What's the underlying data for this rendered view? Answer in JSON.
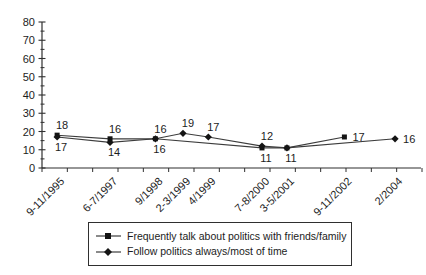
{
  "chart_data": {
    "type": "line",
    "title": "",
    "xlabel": "",
    "ylabel": "",
    "categories": [
      "9-11/1995",
      "6-7/1997",
      "9/1998",
      "2-3/1999",
      "4/1999",
      "7-8/2000",
      "3-5/2001",
      "9-11/2002",
      "2/2004"
    ],
    "series": [
      {
        "name": "Frequently talk about politics with friends/family",
        "marker": "square",
        "points": [
          {
            "category": "9-11/1995",
            "value": 18,
            "label_pos": "above"
          },
          {
            "category": "6-7/1997",
            "value": 16,
            "label_pos": "above"
          },
          {
            "category": "9/1998",
            "value": 16,
            "label_pos": "above"
          },
          {
            "category": "7-8/2000",
            "value": 11,
            "label_pos": "below"
          },
          {
            "category": "3-5/2001",
            "value": 11,
            "label_pos": "below"
          },
          {
            "category": "9-11/2002",
            "value": 17,
            "label_pos": "right"
          }
        ]
      },
      {
        "name": "Follow politics always/most of time",
        "marker": "diamond",
        "points": [
          {
            "category": "9-11/1995",
            "value": 17,
            "label_pos": "below"
          },
          {
            "category": "6-7/1997",
            "value": 14,
            "label_pos": "below"
          },
          {
            "category": "9/1998",
            "value": 16,
            "label_pos": "below"
          },
          {
            "category": "2-3/1999",
            "value": 19,
            "label_pos": "above"
          },
          {
            "category": "4/1999",
            "value": 17,
            "label_pos": "above"
          },
          {
            "category": "7-8/2000",
            "value": 12,
            "label_pos": "above"
          },
          {
            "category": "3-5/2001",
            "value": 11,
            "label_pos": "none"
          },
          {
            "category": "2/2004",
            "value": 16,
            "label_pos": "right"
          }
        ]
      }
    ],
    "y_axis": {
      "min": 0,
      "max": 80,
      "major_step": 10,
      "minor_step": 5,
      "tick_labels": [
        "0",
        "10",
        "20",
        "30",
        "40",
        "50",
        "60",
        "70",
        "80"
      ]
    },
    "x_axis": {
      "tick_count": 16,
      "label_rotation_deg": -45
    },
    "legend": {
      "position": "bottom-center",
      "border": true
    },
    "layout": {
      "grid": false,
      "x_fractions": [
        0.04,
        0.18,
        0.3,
        0.373,
        0.44,
        0.582,
        0.648,
        0.8,
        0.934
      ],
      "plot": {
        "left": 42,
        "right": 420,
        "top": 22,
        "bottom": 168
      },
      "line_color": "#3c3c3c",
      "marker_color": "#141414",
      "axis_color": "#2f2f2f",
      "text_color": "#1c1c1c",
      "background_color": "#ffffff"
    }
  }
}
